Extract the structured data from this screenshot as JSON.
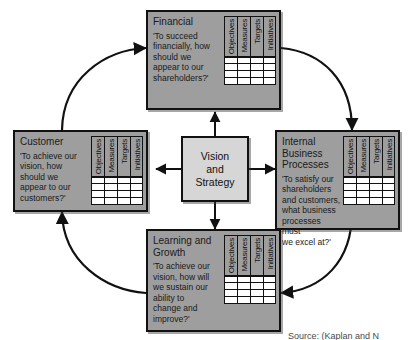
{
  "diagram": {
    "center": {
      "label": "Vision\nand\nStrategy"
    },
    "columns": [
      "Objectives",
      "Measures",
      "Targets",
      "Initiatives"
    ],
    "row_count": 4,
    "panels": [
      {
        "id": "financial",
        "title": "Financial",
        "question": "'To succeed\nfinancially, how\nshould we\nappear to our\nshareholders?'"
      },
      {
        "id": "customer",
        "title": "Customer",
        "question": "'To achieve our\nvision, how\nshould we\nappear to our\ncustomers?'"
      },
      {
        "id": "internal-business-processes",
        "title": "Internal Business\nProcesses",
        "question": "'To satisfy our\nshareholders\nand customers,\nwhat business\nprocesses must\nwe excel at?'"
      },
      {
        "id": "learning-and-growth",
        "title": "Learning and\nGrowth",
        "question": "'To achieve our\nvision, how will\nwe sustain our\nability to\nchange and\nimprove?'"
      }
    ],
    "caption": "Source: (Kaplan and N",
    "colors": {
      "panel_fill": "#9e9e9e",
      "center_fill": "#d6d6d6",
      "stroke": "#111111",
      "cell_fill": "#ffffff",
      "background": "#ffffff"
    }
  }
}
